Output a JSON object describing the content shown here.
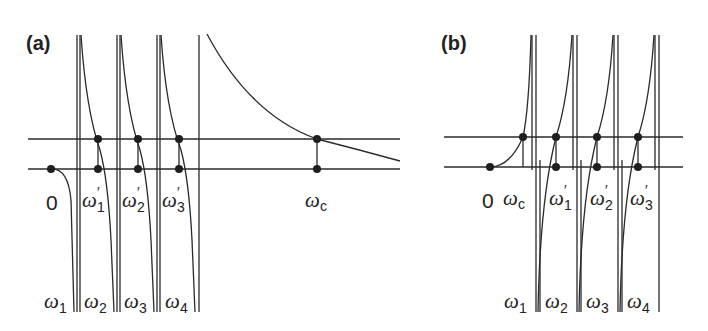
{
  "panels": [
    {
      "id": "a",
      "label": "(a)",
      "origin_label": "0",
      "intersection_labels": [
        {
          "base": "ω",
          "sub": "1",
          "prime": "′"
        },
        {
          "base": "ω",
          "sub": "2",
          "prime": "′"
        },
        {
          "base": "ω",
          "sub": "3",
          "prime": "′"
        },
        {
          "base": "ω",
          "sub": "c",
          "prime": ""
        }
      ],
      "pole_labels": [
        {
          "base": "ω",
          "sub": "1"
        },
        {
          "base": "ω",
          "sub": "2"
        },
        {
          "base": "ω",
          "sub": "3"
        },
        {
          "base": "ω",
          "sub": "4"
        }
      ]
    },
    {
      "id": "b",
      "label": "(b)",
      "origin_label": "0",
      "intersection_labels": [
        {
          "base": "ω",
          "sub": "c",
          "prime": ""
        },
        {
          "base": "ω",
          "sub": "1",
          "prime": "′"
        },
        {
          "base": "ω",
          "sub": "2",
          "prime": "′"
        },
        {
          "base": "ω",
          "sub": "3",
          "prime": "′"
        }
      ],
      "pole_labels": [
        {
          "base": "ω",
          "sub": "1"
        },
        {
          "base": "ω",
          "sub": "2"
        },
        {
          "base": "ω",
          "sub": "3"
        },
        {
          "base": "ω",
          "sub": "4"
        }
      ]
    }
  ],
  "colors": {
    "ink": "#222222",
    "background": "#ffffff"
  }
}
